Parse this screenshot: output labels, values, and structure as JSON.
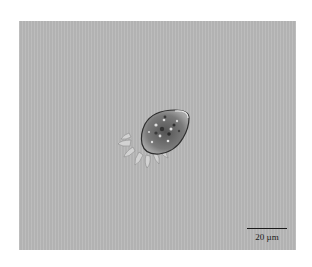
{
  "image": {
    "description": "Bright-field micrograph of a single amoeboid cell with granular cytoplasm and pseudopodia on a uniform gray background",
    "background_color": "#b9b9b9",
    "cell_body_color": "#6a6a6a",
    "cell_edge_color": "#2e2e2e"
  },
  "scale_bar": {
    "label": "20 µm",
    "length_px": 40,
    "color": "#1a1a1a"
  }
}
